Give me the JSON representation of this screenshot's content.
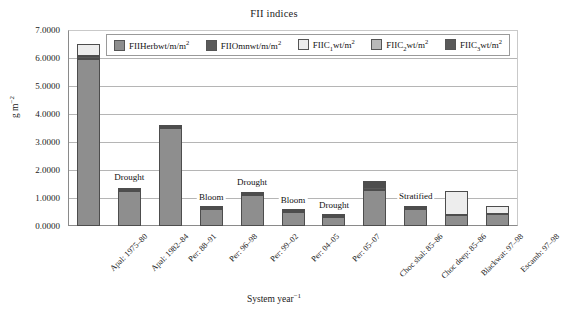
{
  "chart_data": {
    "type": "bar",
    "title": "FII indices",
    "xlabel": "System year⁻¹",
    "ylabel": "g m⁻²",
    "ylim": [
      0.0,
      7.0
    ],
    "ytick_step": 1.0,
    "ytick_labels": [
      "7.0000",
      "6.0000",
      "5.0000",
      "4.0000",
      "3.0000",
      "2.0000",
      "1.0000",
      "0.0000"
    ],
    "ytick_values": [
      7.0,
      6.0,
      5.0,
      4.0,
      3.0,
      2.0,
      1.0,
      0.0
    ],
    "grid": true,
    "stacked": true,
    "legend_position": "top-inside",
    "categories": [
      "Apal: 1975–80",
      "Apal: 1982–84",
      "Per: 88–91",
      "Per: 96–98",
      "Per: 99–02",
      "Per: 04–05",
      "Per: 05–07",
      "Choc shal: 85–86",
      "Choc deep: 85–86",
      "Blackwat: 97–98",
      "Escamb: 97–98"
    ],
    "series": [
      {
        "name": "FIIHerbwt/m2",
        "legend_label": "FIIHerbwt/m",
        "legend_sup": "2",
        "legend_sub": "",
        "color": "#8e8e8e",
        "values": [
          5.95,
          1.25,
          3.5,
          0.62,
          1.12,
          0.5,
          0.33,
          1.3,
          0.62,
          0.38,
          0.42
        ]
      },
      {
        "name": "FIIOmnwt/m2",
        "legend_label": "FIIOmnwt/m",
        "legend_sup": "2",
        "legend_sub": "",
        "color": "#5a5a5a",
        "values": [
          0.12,
          0.04,
          0.02,
          0.02,
          0.03,
          0.02,
          0.01,
          0.1,
          0.02,
          0.01,
          0.01
        ]
      },
      {
        "name": "FIIC1wt/m2",
        "legend_label": "FIIC",
        "legend_sub": "1",
        "legend_sup": "2",
        "color": "#ededed",
        "values": [
          0.43,
          0.06,
          0.01,
          0.01,
          0.02,
          0.01,
          0.01,
          0.07,
          0.04,
          0.85,
          0.28
        ]
      },
      {
        "name": "FIIC2wt/m2",
        "legend_label": "FIIC",
        "legend_sub": "2",
        "legend_sup": "2",
        "color": "#b9b9b9",
        "values": [
          0.0,
          0.0,
          0.0,
          0.0,
          0.0,
          0.0,
          0.0,
          0.05,
          0.0,
          0.0,
          0.0
        ]
      },
      {
        "name": "FIIC3wt/m2",
        "legend_label": "FIIC",
        "legend_sub": "3",
        "legend_sup": "2",
        "color": "#595959",
        "values": [
          0.0,
          0.0,
          0.0,
          0.0,
          0.0,
          0.0,
          0.0,
          0.03,
          0.0,
          0.0,
          0.0
        ]
      }
    ],
    "bar_totals": [
      6.5,
      1.35,
      3.53,
      0.65,
      1.17,
      0.53,
      0.35,
      1.55,
      0.68,
      1.24,
      0.71
    ],
    "annotations": [
      {
        "text": "Drought",
        "category": "Apal: 1982–84"
      },
      {
        "text": "Bloom",
        "category": "Per: 96–98"
      },
      {
        "text": "Drought",
        "category": "Per: 99–02"
      },
      {
        "text": "Bloom",
        "category": "Per: 04–05"
      },
      {
        "text": "Drought",
        "category": "Per: 05–07"
      },
      {
        "text": "Stratified",
        "category": "Choc deep: 85–86"
      }
    ]
  },
  "colors": {
    "axis": "#8a8a8a",
    "grid": "#b5b5b5",
    "frame": "#c9c9c9",
    "text": "#222222",
    "bar_outline": "#4d4d4d"
  }
}
